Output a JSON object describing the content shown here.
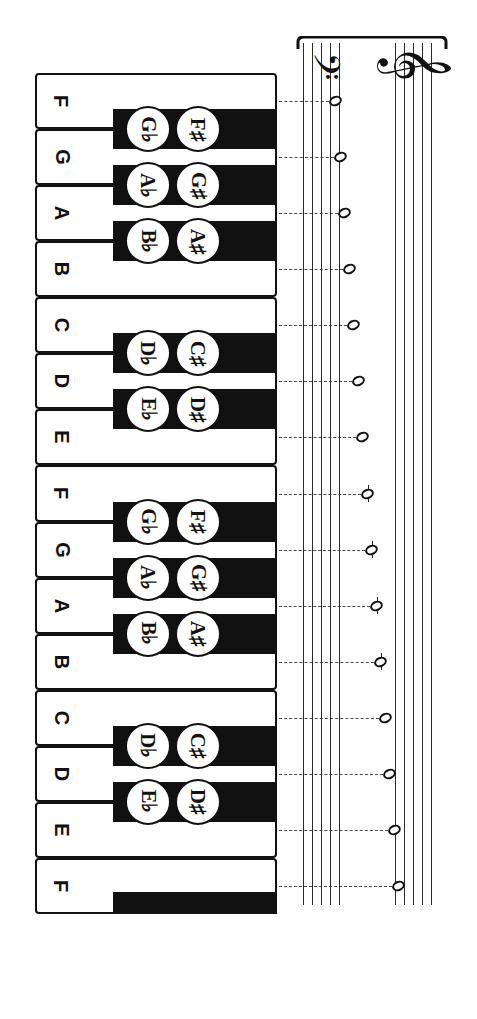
{
  "diagram": {
    "orientation": "rotated-90",
    "colors": {
      "white_key": "#ffffff",
      "black_key": "#111111",
      "outline": "#111111",
      "staff_line": "#2b2b2b",
      "dashed_connector": "#4a4a4a"
    }
  },
  "keyboard": {
    "white_keys": [
      {
        "label": "F",
        "index": 0
      },
      {
        "label": "G",
        "index": 1
      },
      {
        "label": "A",
        "index": 2
      },
      {
        "label": "B",
        "index": 3
      },
      {
        "label": "C",
        "index": 4
      },
      {
        "label": "D",
        "index": 5
      },
      {
        "label": "E",
        "index": 6
      },
      {
        "label": "F",
        "index": 7
      },
      {
        "label": "G",
        "index": 8
      },
      {
        "label": "A",
        "index": 9
      },
      {
        "label": "B",
        "index": 10
      },
      {
        "label": "C",
        "index": 11
      },
      {
        "label": "D",
        "index": 12
      },
      {
        "label": "E",
        "index": 13
      },
      {
        "label": "F",
        "index": 14
      }
    ],
    "black_keys": [
      {
        "flat": "G♭",
        "sharp": "F♯",
        "index": 0
      },
      {
        "flat": "A♭",
        "sharp": "G♯",
        "index": 1
      },
      {
        "flat": "B♭",
        "sharp": "A♯",
        "index": 2
      },
      {
        "flat": "D♭",
        "sharp": "C♯",
        "index": 3
      },
      {
        "flat": "E♭",
        "sharp": "D♯",
        "index": 4
      },
      {
        "flat": "G♭",
        "sharp": "F♯",
        "index": 5
      },
      {
        "flat": "A♭",
        "sharp": "G♯",
        "index": 6
      },
      {
        "flat": "B♭",
        "sharp": "A♯",
        "index": 7
      },
      {
        "flat": "D♭",
        "sharp": "C♯",
        "index": 8
      },
      {
        "flat": "E♭",
        "sharp": "D♯",
        "index": 9
      }
    ]
  },
  "staff": {
    "clefs": [
      {
        "name": "bass-clef",
        "glyph": "𝄢"
      },
      {
        "name": "treble-clef",
        "glyph": "𝄞"
      }
    ],
    "note_value": "whole-note",
    "notes": [
      {
        "pitch": "F",
        "staff": "bass",
        "ledger": false
      },
      {
        "pitch": "G",
        "staff": "bass",
        "ledger": false
      },
      {
        "pitch": "A",
        "staff": "bass",
        "ledger": false
      },
      {
        "pitch": "B",
        "staff": "bass",
        "ledger": false
      },
      {
        "pitch": "C",
        "staff": "bass",
        "ledger": false
      },
      {
        "pitch": "D",
        "staff": "bass",
        "ledger": false
      },
      {
        "pitch": "E",
        "staff": "bass",
        "ledger": false
      },
      {
        "pitch": "F",
        "staff": "treble",
        "ledger": true
      },
      {
        "pitch": "G",
        "staff": "treble",
        "ledger": true
      },
      {
        "pitch": "A",
        "staff": "treble",
        "ledger": true
      },
      {
        "pitch": "B",
        "staff": "treble",
        "ledger": true
      },
      {
        "pitch": "C",
        "staff": "treble",
        "ledger": false
      },
      {
        "pitch": "D",
        "staff": "treble",
        "ledger": false
      },
      {
        "pitch": "E",
        "staff": "treble",
        "ledger": false
      },
      {
        "pitch": "F",
        "staff": "treble",
        "ledger": false
      }
    ]
  }
}
